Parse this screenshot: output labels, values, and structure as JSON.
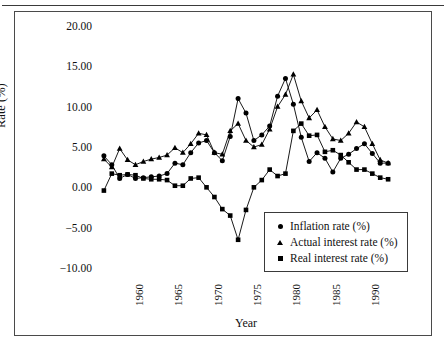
{
  "figure": {
    "y_axis_title": "Rate (%)",
    "x_axis_title": "Year"
  },
  "legend": {
    "items": [
      {
        "label": "Inflation rate (%)",
        "marker": "circle"
      },
      {
        "label": "Actual interest rate (%)",
        "marker": "triangle"
      },
      {
        "label": "Real interest rate (%)",
        "marker": "square"
      }
    ]
  },
  "chart_data": {
    "type": "line",
    "title": "",
    "xlabel": "Year",
    "ylabel": "Rate (%)",
    "xlim": [
      1956,
      1994
    ],
    "ylim": [
      -10,
      20
    ],
    "yticks": [
      20,
      15,
      10,
      5,
      0,
      -5,
      -10
    ],
    "ytick_labels": [
      "20.00",
      "15.00",
      "10.00",
      "5.00",
      "0.00",
      "-5.00",
      "-10.00"
    ],
    "xticks": [
      1960,
      1965,
      1970,
      1975,
      1980,
      1985,
      1990
    ],
    "xtick_labels": [
      "1960",
      "1965",
      "1970",
      "1975",
      "1980",
      "1985",
      "1990"
    ],
    "grid": false,
    "legend_position": "lower-right-inside",
    "x": [
      1957,
      1958,
      1959,
      1960,
      1961,
      1962,
      1963,
      1964,
      1965,
      1966,
      1967,
      1968,
      1969,
      1970,
      1971,
      1972,
      1973,
      1974,
      1975,
      1976,
      1977,
      1978,
      1979,
      1980,
      1981,
      1982,
      1983,
      1984,
      1985,
      1986,
      1987,
      1988,
      1989,
      1990,
      1991,
      1992,
      1993
    ],
    "series": [
      {
        "name": "Inflation rate (%)",
        "marker": "circle",
        "values": [
          3.9,
          2.8,
          1.1,
          1.6,
          1.1,
          1.2,
          1.3,
          1.4,
          1.7,
          3.0,
          2.8,
          4.3,
          5.5,
          5.8,
          4.3,
          3.3,
          6.3,
          11.0,
          9.2,
          5.8,
          6.5,
          7.6,
          11.3,
          13.5,
          10.3,
          6.2,
          3.2,
          4.3,
          3.6,
          1.9,
          3.6,
          4.1,
          4.8,
          5.4,
          4.2,
          3.0,
          3.0
        ]
      },
      {
        "name": "Actual interest rate (%)",
        "marker": "triangle",
        "values": [
          3.5,
          2.5,
          4.8,
          3.4,
          2.8,
          3.2,
          3.5,
          3.7,
          4.0,
          4.9,
          4.3,
          5.4,
          6.7,
          6.5,
          4.3,
          4.1,
          7.0,
          7.9,
          5.8,
          5.0,
          5.3,
          7.2,
          10.0,
          11.5,
          14.0,
          10.7,
          8.6,
          9.6,
          7.5,
          6.0,
          5.8,
          6.7,
          8.1,
          7.5,
          5.4,
          3.4,
          3.0
        ]
      },
      {
        "name": "Real interest rate (%)",
        "marker": "square",
        "values": [
          -0.4,
          1.7,
          1.5,
          1.6,
          1.5,
          1.1,
          1.0,
          1.0,
          0.9,
          0.2,
          0.2,
          1.1,
          1.2,
          0.0,
          -1.2,
          -2.7,
          -3.5,
          -6.5,
          -2.8,
          0.0,
          0.9,
          2.2,
          1.4,
          1.7,
          7.0,
          7.9,
          6.4,
          6.5,
          4.4,
          4.6,
          4.0,
          3.1,
          2.2,
          2.2,
          1.7,
          1.2,
          1.0
        ]
      }
    ]
  }
}
